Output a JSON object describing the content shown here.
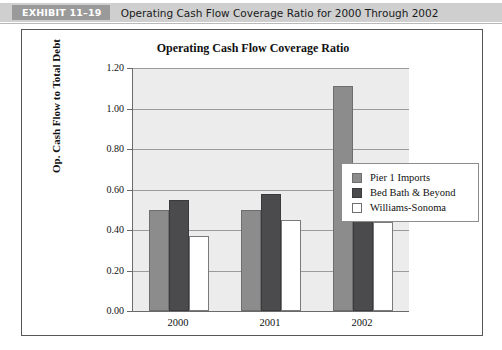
{
  "exhibit": {
    "tag": "EXHIBIT 11–19",
    "caption": "Operating Cash Flow Coverage Ratio for 2000 Through 2002"
  },
  "legend": {
    "position": "inside-right"
  },
  "chart_data": {
    "type": "bar",
    "title": "Operating Cash Flow Coverage Ratio",
    "xlabel": "",
    "ylabel": "Op. Cash Flow to Total Debt",
    "categories": [
      "2000",
      "2001",
      "2002"
    ],
    "ylim": [
      0.0,
      1.2
    ],
    "yticks": [
      "0.00",
      "0.20",
      "0.40",
      "0.60",
      "0.80",
      "1.00",
      "1.20"
    ],
    "ytick_values": [
      0.0,
      0.2,
      0.4,
      0.6,
      0.8,
      1.0,
      1.2
    ],
    "grid": true,
    "series": [
      {
        "name": "Pier 1 Imports",
        "color": "#8c8c8c",
        "values": [
          0.5,
          0.5,
          1.11
        ]
      },
      {
        "name": "Bed Bath & Beyond",
        "color": "#4b4b4d",
        "values": [
          0.55,
          0.58,
          0.73
        ]
      },
      {
        "name": "Williams-Sonoma",
        "color": "#ffffff",
        "values": [
          0.37,
          0.45,
          0.44
        ]
      }
    ]
  }
}
